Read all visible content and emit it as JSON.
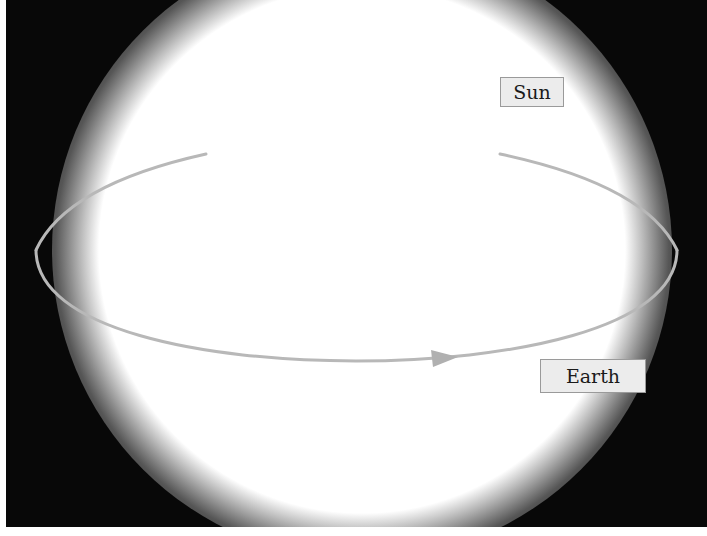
{
  "diagram": {
    "type": "orbit-diagram",
    "labels": {
      "sun": "Sun",
      "earth": "Earth"
    },
    "colors": {
      "background": "#080808",
      "sun": "#ffffff",
      "orbit": "#b8b8b8",
      "label_background": "#ececec",
      "label_text": "#1a1a1a"
    },
    "orbit": {
      "shape": "ellipse",
      "direction": "counterclockwise-front-left-to-right",
      "arrow": "arrowhead on front arc pointing right"
    }
  }
}
